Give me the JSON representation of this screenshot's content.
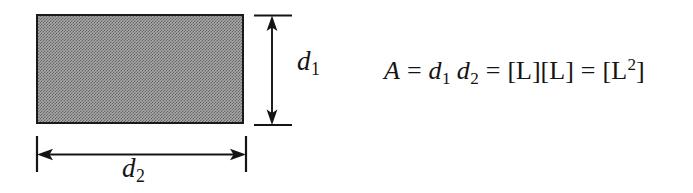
{
  "figure": {
    "name": "area-dimensional-analysis",
    "background_color": "#ffffff",
    "ink_color": "#141414",
    "shape": {
      "kind": "rectangle",
      "fill": "shaded-gray-dither",
      "fill_color": "#a8a8a8",
      "border_color": "#1a1a1a",
      "border_width_px": 2
    },
    "dimensions": {
      "vertical": {
        "name": "d1",
        "label_variable": "d",
        "label_subscript": "1",
        "arrow_style": "double-headed",
        "extension_lines": true
      },
      "horizontal": {
        "name": "d2",
        "label_variable": "d",
        "label_subscript": "2",
        "arrow_style": "double-headed",
        "extension_lines": true
      }
    },
    "equation": {
      "full_text": "A = d1 d2 = [L][L] = [L2]",
      "area_symbol": "A",
      "equals": "=",
      "term_1_variable": "d",
      "term_1_subscript": "1",
      "term_2_variable": "d",
      "term_2_subscript": "2",
      "dimension_product": "[L][L]",
      "dimension_bracket_open": "[",
      "dimension_letter": "L",
      "dimension_exponent": "2",
      "dimension_bracket_close": "]"
    }
  }
}
